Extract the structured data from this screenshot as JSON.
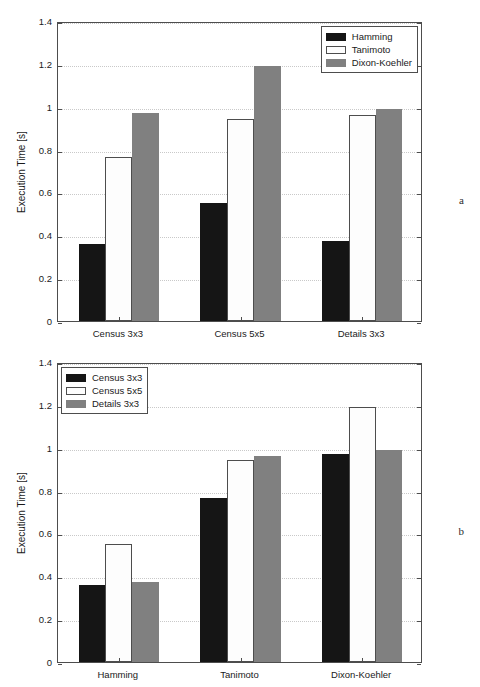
{
  "figure": {
    "background": "#ffffff",
    "width": 480,
    "height": 687
  },
  "axis_style": {
    "frame_color": "#4d4d4d",
    "grid_color": "#c9c9c9",
    "grid": "horizontal-dotted"
  },
  "series_colors": {
    "black": "#151515",
    "white": "#fdfdfd",
    "gray": "#808080"
  },
  "panels": [
    {
      "letter": "a",
      "ylabel": "Execution Time [s]",
      "yticks": [
        "0",
        "0.2",
        "0.4",
        "0.6",
        "0.8",
        "1",
        "1.2",
        "1.4"
      ],
      "xticks": [
        "Census 3x3",
        "Census 5x5",
        "Details 3x3"
      ],
      "legend": [
        "Hamming",
        "Tanimoto",
        "Dixon-Koehler"
      ]
    },
    {
      "letter": "b",
      "ylabel": "Execution Time [s]",
      "yticks": [
        "0",
        "0.2",
        "0.4",
        "0.6",
        "0.8",
        "1",
        "1.2",
        "1.4"
      ],
      "xticks": [
        "Hamming",
        "Tanimoto",
        "Dixon-Koehler"
      ],
      "legend": [
        "Census 3x3",
        "Census 5x5",
        "Details 3x3"
      ]
    }
  ],
  "chart_data": [
    {
      "type": "bar",
      "panel": "a",
      "title": "",
      "xlabel": "",
      "ylabel": "Execution Time [s]",
      "ylim": [
        0,
        1.4
      ],
      "ytick_values": [
        0,
        0.2,
        0.4,
        0.6,
        0.8,
        1.0,
        1.2,
        1.4
      ],
      "grid": true,
      "legend_position": "top-right",
      "categories": [
        "Census 3x3",
        "Census 5x5",
        "Details 3x3"
      ],
      "series": [
        {
          "name": "Hamming",
          "color": "#151515",
          "values": [
            0.36,
            0.55,
            0.375
          ]
        },
        {
          "name": "Tanimoto",
          "color": "#fdfdfd",
          "values": [
            0.765,
            0.945,
            0.96
          ]
        },
        {
          "name": "Dixon-Koehler",
          "color": "#808080",
          "values": [
            0.97,
            1.19,
            0.99
          ]
        }
      ]
    },
    {
      "type": "bar",
      "panel": "b",
      "title": "",
      "xlabel": "",
      "ylabel": "Execution Time [s]",
      "ylim": [
        0,
        1.4
      ],
      "ytick_values": [
        0,
        0.2,
        0.4,
        0.6,
        0.8,
        1.0,
        1.2,
        1.4
      ],
      "grid": true,
      "legend_position": "top-left",
      "categories": [
        "Hamming",
        "Tanimoto",
        "Dixon-Koehler"
      ],
      "series": [
        {
          "name": "Census 3x3",
          "color": "#151515",
          "values": [
            0.36,
            0.765,
            0.97
          ]
        },
        {
          "name": "Census 5x5",
          "color": "#fdfdfd",
          "values": [
            0.55,
            0.945,
            1.19
          ]
        },
        {
          "name": "Details 3x3",
          "color": "#808080",
          "values": [
            0.375,
            0.96,
            0.99
          ]
        }
      ]
    }
  ]
}
